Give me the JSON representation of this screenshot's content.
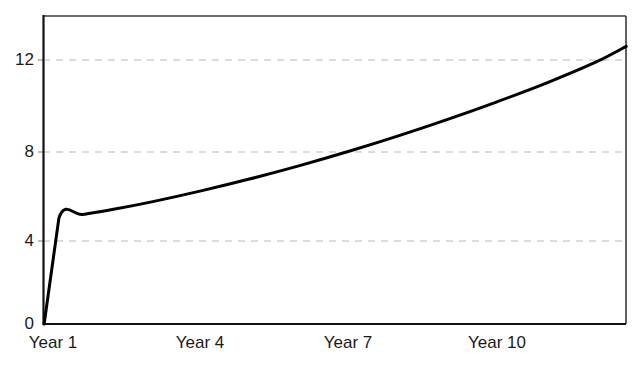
{
  "chart_data": {
    "type": "line",
    "title": "",
    "subtitle": "",
    "xlabel": "",
    "ylabel": "",
    "xtick_labels": [
      "Year 1",
      "Year 4",
      "Year 7",
      "Year 10"
    ],
    "xtick_values": [
      1,
      4,
      7,
      10
    ],
    "ytick_labels": [
      "0",
      "4",
      "8",
      "12"
    ],
    "ytick_values": [
      0,
      4,
      8,
      12
    ],
    "xlim": [
      0.8,
      12.6
    ],
    "ylim": [
      0,
      14
    ],
    "grid": "horizontal-dashed",
    "legend": "none",
    "series": [
      {
        "name": "value",
        "color": "#000000",
        "line_width": 3,
        "x": [
          0.82,
          1.12,
          1.6,
          2.2,
          3.0,
          4.0,
          5.0,
          6.0,
          7.0,
          8.0,
          9.0,
          10.0,
          11.0,
          12.0,
          12.62
        ],
        "values": [
          0.0,
          4.82,
          4.98,
          5.2,
          5.55,
          6.05,
          6.6,
          7.2,
          7.85,
          8.55,
          9.3,
          10.1,
          10.95,
          11.9,
          12.62
        ]
      }
    ],
    "annotations": []
  },
  "axes": {
    "frame_color": "#1a1a1a",
    "grid_color": "#b9b9b9",
    "background": "#ffffff",
    "plot_left_px": 43,
    "plot_right_px": 626,
    "plot_top_px": 16,
    "plot_bottom_px": 324,
    "ytick_px": {
      "0": 324,
      "4": 241,
      "8": 152,
      "12": 60
    },
    "xtick_px": {
      "Year 1": 53,
      "Year 4": 200,
      "Year 7": 348,
      "Year 10": 497
    }
  }
}
